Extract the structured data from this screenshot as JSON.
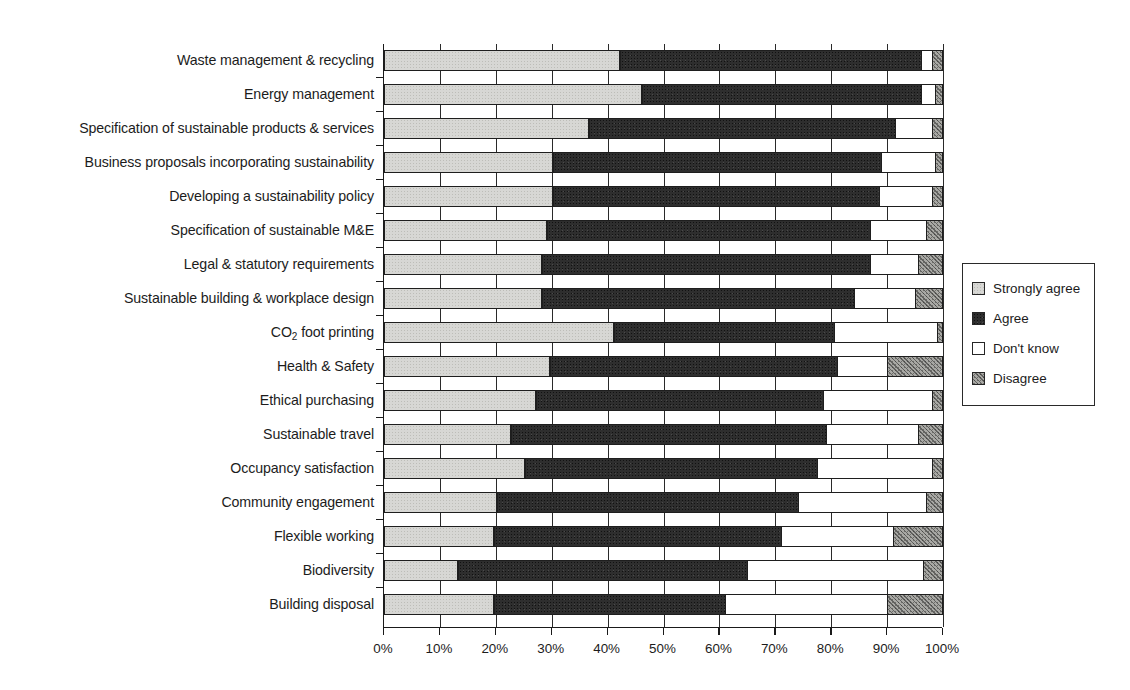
{
  "chart_data": {
    "type": "bar",
    "subtype": "horizontal-stacked-100-percent",
    "title": "",
    "xlabel": "",
    "ylabel": "",
    "xlim": [
      0,
      100
    ],
    "xtick_labels": [
      "0%",
      "10%",
      "20%",
      "30%",
      "40%",
      "50%",
      "60%",
      "70%",
      "80%",
      "90%",
      "100%"
    ],
    "xtick_values": [
      0,
      10,
      20,
      30,
      40,
      50,
      60,
      70,
      80,
      90,
      100
    ],
    "grid": true,
    "legend_position": "right",
    "legend_entries": [
      "Strongly agree",
      "Agree",
      "Don't know",
      "Disagree"
    ],
    "series": [
      {
        "name": "Strongly agree",
        "color": "#d7d7d4",
        "values": [
          42,
          46,
          36.5,
          30,
          30,
          29,
          28,
          28,
          41,
          29.5,
          27,
          22.5,
          25,
          20,
          19.5,
          13,
          19.5
        ]
      },
      {
        "name": "Agree",
        "color": "#2e2e2e",
        "values": [
          54,
          50,
          55,
          59,
          58.5,
          58,
          59,
          56,
          39.5,
          51.5,
          51.5,
          56.5,
          52.5,
          54,
          51.5,
          52,
          41.5
        ]
      },
      {
        "name": "Don't know",
        "color": "#ffffff",
        "values": [
          2,
          2.5,
          6.5,
          9.5,
          9.5,
          10,
          8.5,
          11,
          18.5,
          9,
          19.5,
          16.5,
          20.5,
          23,
          20,
          31.5,
          29
        ]
      },
      {
        "name": "Disagree",
        "color": "#a8a8a4",
        "values": [
          2,
          1.5,
          2,
          1.5,
          2,
          3,
          4.5,
          5,
          1,
          10,
          2,
          4.5,
          2,
          3,
          9,
          3.5,
          10
        ]
      }
    ],
    "categories": [
      "Waste management & recycling",
      "Energy management",
      "Specification of sustainable products & services",
      "Business proposals incorporating sustainability",
      "Developing a sustainability policy",
      "Specification of sustainable M&E",
      "Legal & statutory requirements",
      "Sustainable building & workplace design",
      "CO2 foot printing",
      "Health & Safety",
      "Ethical purchasing",
      "Sustainable travel",
      "Occupancy satisfaction",
      "Community engagement",
      "Flexible working",
      "Biodiversity",
      "Building disposal"
    ],
    "categories_html": [
      "Waste management &amp; recycling",
      "Energy management",
      "Specification of sustainable products &amp; services",
      "Business proposals incorporating sustainability",
      "Developing a sustainability policy",
      "Specification of sustainable M&amp;E",
      "Legal &amp; statutory requirements",
      "Sustainable building &amp; workplace design",
      "CO<sub>2</sub> foot printing",
      "Health &amp; Safety",
      "Ethical purchasing",
      "Sustainable travel",
      "Occupancy satisfaction",
      "Community engagement",
      "Flexible working",
      "Biodiversity",
      "Building disposal"
    ]
  },
  "legend": {
    "items": [
      {
        "label": "Strongly agree",
        "swatch": "strongly"
      },
      {
        "label": "Agree",
        "swatch": "agree"
      },
      {
        "label": "Don't know",
        "swatch": "dontknow"
      },
      {
        "label": "Disagree",
        "swatch": "disagree"
      }
    ]
  },
  "colors": {
    "strongly_agree": "#d7d7d4",
    "agree": "#2e2e2e",
    "dont_know": "#ffffff",
    "disagree": "#a8a8a4",
    "axis": "#1a1a1a",
    "text": "#1c1c1c"
  }
}
